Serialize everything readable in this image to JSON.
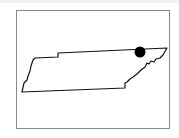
{
  "map": {
    "region": "Tennessee",
    "outline_color": "#111111",
    "frame_color": "#8a8a8a",
    "marker": {
      "color": "#000000",
      "cx": 140,
      "cy": 52,
      "r": 5.5
    },
    "outline_points": "22,92 24,83 27,80 28,76 30,71 31,66 33,60 35,58 58,57 58,53 167,48 163,55 160,58 156,59 154,62 151,61 149,64 147,63 145,67 141,70 137,74 133,77 130,79 127,82 125,83 125,88 22,92"
  }
}
